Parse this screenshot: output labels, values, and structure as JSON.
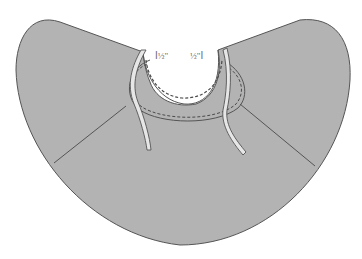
{
  "diagram": {
    "colors": {
      "background": "#ffffff",
      "fabric_fill": "#b3b3b3",
      "outline": "#555555",
      "stitch": "#4a4a4a",
      "tie_fill": "#e6e6e6",
      "label_text": "#6a6a6a"
    },
    "annotations": {
      "left_measure": {
        "bracket": "I",
        "value": "½\""
      },
      "right_measure": {
        "value": "½\"",
        "bracket": "I"
      }
    },
    "parts": [
      {
        "name": "cape-body",
        "description": "large curved cape panel"
      },
      {
        "name": "neck-facing",
        "description": "oval collar band with dashed topstitching"
      },
      {
        "name": "left-tie",
        "description": "narrow tie hanging from left neck edge"
      },
      {
        "name": "right-tie",
        "description": "narrow tie hanging from right neck edge"
      },
      {
        "name": "left-seam",
        "description": "diagonal seam line on left"
      },
      {
        "name": "right-seam",
        "description": "diagonal seam line on right"
      }
    ]
  }
}
